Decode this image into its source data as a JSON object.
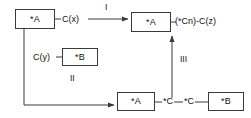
{
  "diagram": {
    "type": "reaction-scheme",
    "stroke_color": "#3a3a3a",
    "text_color": "#111111",
    "background": "#ffffff",
    "nodes": [
      {
        "id": "a_top",
        "label": "*A",
        "role": "reactant-block-top-left"
      },
      {
        "id": "a_product",
        "label": "*A",
        "role": "product-block-top-right"
      },
      {
        "id": "b_mid",
        "label": "*B",
        "role": "reactant-block-middle"
      },
      {
        "id": "a_bottom",
        "label": "*A",
        "role": "intermediate-block-bottom-left"
      },
      {
        "id": "b_bottom",
        "label": "*B",
        "role": "intermediate-block-bottom-right"
      }
    ],
    "inline_labels": {
      "cx": "C(x)",
      "cy": "C(y)",
      "product_chain": "(*Cn)-C(z)",
      "atom_c_first": "*C",
      "atom_c_second": "*C"
    },
    "step_labels": {
      "step_one": "I",
      "step_two": "II",
      "step_three": "III"
    },
    "connectors": [
      {
        "id": "a_top_to_cx",
        "kind": "line",
        "from": "a_top",
        "to": "cx"
      },
      {
        "id": "step_one_arrow",
        "kind": "arrow",
        "from": "cx",
        "to": "a_product",
        "label": "I"
      },
      {
        "id": "a_product_to_chain",
        "kind": "line",
        "from": "a_product",
        "to": "product_chain"
      },
      {
        "id": "cy_to_b_mid",
        "kind": "line",
        "from": "cy",
        "to": "b_mid"
      },
      {
        "id": "step_two_arrow",
        "kind": "arrow",
        "from": "a_top",
        "to": "a_bottom",
        "label": "II",
        "path": "elbow-down-right"
      },
      {
        "id": "a_bottom_to_c_first",
        "kind": "line",
        "from": "a_bottom",
        "to": "atom_c_first"
      },
      {
        "id": "c_first_to_c_second",
        "kind": "line",
        "from": "atom_c_first",
        "to": "atom_c_second"
      },
      {
        "id": "c_second_to_b_bottom",
        "kind": "line",
        "from": "atom_c_second",
        "to": "b_bottom"
      },
      {
        "id": "step_three_arrow",
        "kind": "arrow",
        "from": "bottom_chain",
        "to": "a_product",
        "label": "III",
        "path": "vertical-up"
      }
    ]
  }
}
